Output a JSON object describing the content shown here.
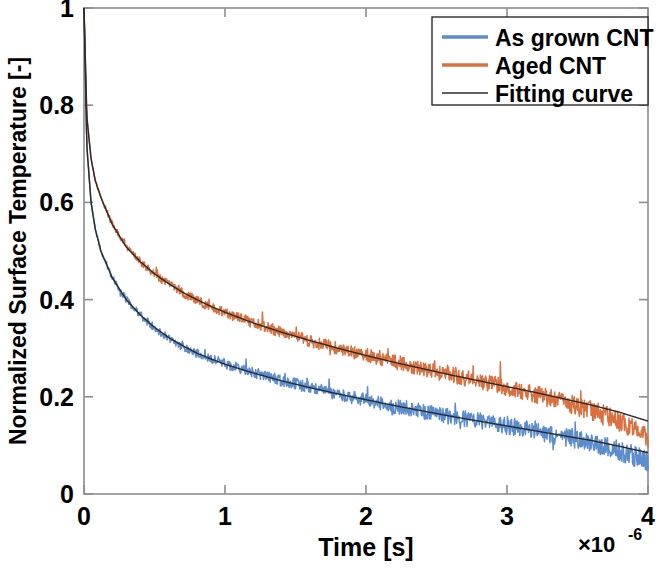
{
  "chart_data": {
    "type": "line",
    "title": "",
    "xlabel": "Time [s]",
    "ylabel": "Normalized Surface Temperature [-]",
    "x_exponent_label": "×10",
    "x_exponent_value": "-6",
    "x_multiplier": 1e-06,
    "xlim": [
      0,
      4
    ],
    "ylim": [
      0,
      1
    ],
    "xticks": [
      "0",
      "1",
      "2",
      "3",
      "4"
    ],
    "xtick_values": [
      0,
      1,
      2,
      3,
      4
    ],
    "yticks": [
      "0",
      "0.2",
      "0.4",
      "0.6",
      "0.8",
      "1"
    ],
    "ytick_values": [
      0,
      0.2,
      0.4,
      0.6,
      0.8,
      1
    ],
    "grid": false,
    "legend_position": "top-right",
    "colors": {
      "as_grown": "#5b8ccd",
      "aged": "#d9703f",
      "fit": "#2b2b2b",
      "axis": "#8c8c8c",
      "text": "#000000",
      "background": "#ffffff"
    },
    "series": [
      {
        "name": "As grown CNT",
        "color": "#5b8ccd",
        "style": "noisy-data",
        "x": [
          0.0,
          0.02,
          0.05,
          0.08,
          0.12,
          0.2,
          0.3,
          0.4,
          0.5,
          0.6,
          0.7,
          0.8,
          0.9,
          1.0,
          1.2,
          1.4,
          1.6,
          1.8,
          2.0,
          2.2,
          2.4,
          2.6,
          2.8,
          3.0,
          3.2,
          3.4,
          3.6,
          3.8,
          4.0
        ],
        "values": [
          1.0,
          0.72,
          0.6,
          0.545,
          0.5,
          0.445,
          0.4,
          0.368,
          0.342,
          0.32,
          0.303,
          0.29,
          0.278,
          0.268,
          0.25,
          0.233,
          0.22,
          0.205,
          0.193,
          0.18,
          0.17,
          0.16,
          0.15,
          0.14,
          0.13,
          0.118,
          0.105,
          0.088,
          0.068
        ]
      },
      {
        "name": "Aged CNT",
        "color": "#d9703f",
        "style": "noisy-data",
        "x": [
          0.0,
          0.02,
          0.05,
          0.08,
          0.12,
          0.2,
          0.3,
          0.4,
          0.5,
          0.6,
          0.7,
          0.8,
          0.9,
          1.0,
          1.2,
          1.4,
          1.6,
          1.8,
          2.0,
          2.2,
          2.4,
          2.6,
          2.8,
          3.0,
          3.2,
          3.4,
          3.6,
          3.8,
          4.0
        ],
        "values": [
          1.0,
          0.78,
          0.69,
          0.645,
          0.61,
          0.555,
          0.51,
          0.478,
          0.452,
          0.432,
          0.414,
          0.398,
          0.385,
          0.373,
          0.352,
          0.333,
          0.315,
          0.3,
          0.286,
          0.272,
          0.258,
          0.245,
          0.232,
          0.22,
          0.205,
          0.19,
          0.172,
          0.15,
          0.118
        ]
      },
      {
        "name": "Fitting curve",
        "color": "#2b2b2b",
        "style": "smooth-fit",
        "fits": [
          {
            "for": "As grown CNT",
            "x": [
              0.0,
              0.02,
              0.05,
              0.08,
              0.12,
              0.2,
              0.3,
              0.4,
              0.5,
              0.6,
              0.7,
              0.8,
              0.9,
              1.0,
              1.2,
              1.4,
              1.6,
              1.8,
              2.0,
              2.2,
              2.4,
              2.6,
              2.8,
              3.0,
              3.2,
              3.4,
              3.6,
              3.8,
              4.0
            ],
            "values": [
              1.0,
              0.715,
              0.6,
              0.545,
              0.5,
              0.445,
              0.4,
              0.368,
              0.343,
              0.322,
              0.305,
              0.29,
              0.278,
              0.267,
              0.249,
              0.233,
              0.219,
              0.206,
              0.194,
              0.182,
              0.171,
              0.16,
              0.15,
              0.14,
              0.13,
              0.12,
              0.11,
              0.098,
              0.085
            ]
          },
          {
            "for": "Aged CNT",
            "x": [
              0.0,
              0.02,
              0.05,
              0.08,
              0.12,
              0.2,
              0.3,
              0.4,
              0.5,
              0.6,
              0.7,
              0.8,
              0.9,
              1.0,
              1.2,
              1.4,
              1.6,
              1.8,
              2.0,
              2.2,
              2.4,
              2.6,
              2.8,
              3.0,
              3.2,
              3.4,
              3.6,
              3.8,
              4.0
            ],
            "values": [
              1.0,
              0.775,
              0.69,
              0.645,
              0.61,
              0.555,
              0.508,
              0.478,
              0.453,
              0.433,
              0.415,
              0.4,
              0.386,
              0.374,
              0.352,
              0.333,
              0.316,
              0.3,
              0.285,
              0.271,
              0.258,
              0.245,
              0.233,
              0.221,
              0.209,
              0.196,
              0.183,
              0.168,
              0.15
            ]
          }
        ]
      }
    ],
    "legend": [
      {
        "label": "As grown CNT",
        "color": "#5b8ccd"
      },
      {
        "label": "Aged CNT",
        "color": "#d9703f"
      },
      {
        "label": "Fitting curve",
        "color": "#2b2b2b"
      }
    ]
  }
}
